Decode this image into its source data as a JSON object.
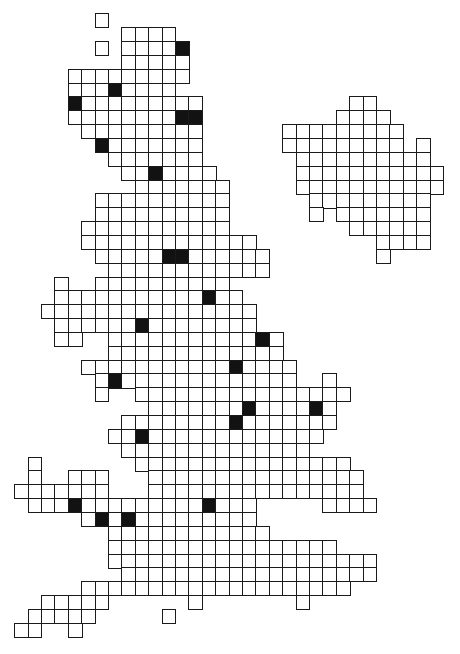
{
  "map": {
    "type": "grid-cartogram",
    "colors": {
      "background": "#ffffff",
      "cell_border": "#1a1a1a",
      "cell_empty": "#ffffff",
      "cell_filled": "#121212"
    },
    "regions": [
      {
        "name": "great-britain",
        "rows": [
          {
            "r": 0,
            "runs": [
              [
                2,
                2
              ]
            ],
            "filled": []
          },
          {
            "r": 1,
            "runs": [
              [
                4,
                7
              ]
            ],
            "filled": []
          },
          {
            "r": 2,
            "runs": [
              [
                2,
                2
              ],
              [
                4,
                8
              ]
            ],
            "filled": [
              8
            ]
          },
          {
            "r": 3,
            "runs": [
              [
                4,
                8
              ]
            ],
            "filled": []
          },
          {
            "r": 4,
            "runs": [
              [
                0,
                8
              ]
            ],
            "filled": []
          },
          {
            "r": 5,
            "runs": [
              [
                0,
                7
              ]
            ],
            "filled": [
              3
            ]
          },
          {
            "r": 6,
            "runs": [
              [
                0,
                9
              ]
            ],
            "filled": [
              0
            ]
          },
          {
            "r": 7,
            "runs": [
              [
                0,
                9
              ]
            ],
            "filled": [
              8,
              9
            ]
          },
          {
            "r": 8,
            "runs": [
              [
                1,
                9
              ]
            ],
            "filled": []
          },
          {
            "r": 9,
            "runs": [
              [
                2,
                9
              ]
            ],
            "filled": [
              2
            ]
          },
          {
            "r": 10,
            "runs": [
              [
                3,
                9
              ]
            ],
            "filled": []
          },
          {
            "r": 11,
            "runs": [
              [
                4,
                10
              ]
            ],
            "filled": [
              6
            ]
          },
          {
            "r": 12,
            "runs": [
              [
                5,
                11
              ]
            ],
            "filled": []
          },
          {
            "r": 13,
            "runs": [
              [
                2,
                11
              ]
            ],
            "filled": []
          },
          {
            "r": 14,
            "runs": [
              [
                2,
                11
              ]
            ],
            "filled": []
          },
          {
            "r": 15,
            "runs": [
              [
                1,
                11
              ]
            ],
            "filled": []
          },
          {
            "r": 16,
            "runs": [
              [
                1,
                13
              ]
            ],
            "filled": []
          },
          {
            "r": 17,
            "runs": [
              [
                2,
                14
              ]
            ],
            "filled": [
              7,
              8
            ]
          },
          {
            "r": 18,
            "runs": [
              [
                3,
                14
              ]
            ],
            "filled": []
          },
          {
            "r": 19,
            "runs": [
              [
                -1,
                -1
              ],
              [
                2,
                11
              ]
            ],
            "filled": []
          },
          {
            "r": 20,
            "runs": [
              [
                -1,
                12
              ]
            ],
            "filled": [
              10
            ]
          },
          {
            "r": 21,
            "runs": [
              [
                -2,
                13
              ]
            ],
            "filled": []
          },
          {
            "r": 22,
            "runs": [
              [
                -1,
                13
              ]
            ],
            "filled": [
              5
            ]
          },
          {
            "r": 23,
            "runs": [
              [
                -1,
                0
              ],
              [
                3,
                15
              ]
            ],
            "filled": [
              14
            ]
          },
          {
            "r": 24,
            "runs": [
              [
                3,
                15
              ]
            ],
            "filled": []
          },
          {
            "r": 25,
            "runs": [
              [
                1,
                16
              ]
            ],
            "filled": [
              12
            ]
          },
          {
            "r": 26,
            "runs": [
              [
                2,
                16
              ],
              [
                19,
                19
              ]
            ],
            "filled": [
              3
            ]
          },
          {
            "r": 27,
            "runs": [
              [
                2,
                2
              ],
              [
                5,
                20
              ]
            ],
            "filled": []
          },
          {
            "r": 28,
            "runs": [
              [
                6,
                19
              ]
            ],
            "filled": [
              13,
              18
            ]
          },
          {
            "r": 29,
            "runs": [
              [
                4,
                19
              ]
            ],
            "filled": [
              12
            ]
          },
          {
            "r": 30,
            "runs": [
              [
                3,
                18
              ]
            ],
            "filled": [
              5
            ]
          },
          {
            "r": 31,
            "runs": [
              [
                4,
                17
              ]
            ],
            "filled": []
          },
          {
            "r": 32,
            "runs": [
              [
                -3,
                -3
              ],
              [
                5,
                20
              ]
            ],
            "filled": []
          },
          {
            "r": 33,
            "runs": [
              [
                -3,
                -3
              ],
              [
                0,
                2
              ],
              [
                6,
                21
              ]
            ],
            "filled": []
          },
          {
            "r": 34,
            "runs": [
              [
                -4,
                2
              ],
              [
                6,
                21
              ]
            ],
            "filled": []
          },
          {
            "r": 35,
            "runs": [
              [
                -3,
                13
              ],
              [
                19,
                22
              ]
            ],
            "filled": [
              0,
              10
            ]
          },
          {
            "r": 36,
            "runs": [
              [
                1,
                13
              ]
            ],
            "filled": [
              2,
              4
            ]
          },
          {
            "r": 37,
            "runs": [
              [
                3,
                14
              ]
            ],
            "filled": []
          },
          {
            "r": 38,
            "runs": [
              [
                3,
                19
              ]
            ],
            "filled": []
          },
          {
            "r": 39,
            "runs": [
              [
                3,
                22
              ]
            ],
            "filled": []
          },
          {
            "r": 40,
            "runs": [
              [
                4,
                22
              ]
            ],
            "filled": []
          },
          {
            "r": 41,
            "runs": [
              [
                1,
                20
              ]
            ],
            "filled": []
          },
          {
            "r": 42,
            "runs": [
              [
                -2,
                2
              ],
              [
                9,
                9
              ],
              [
                17,
                17
              ]
            ],
            "filled": []
          },
          {
            "r": 43,
            "runs": [
              [
                -3,
                1
              ],
              [
                7,
                7
              ]
            ],
            "filled": []
          },
          {
            "r": 44,
            "runs": [
              [
                -4,
                -3
              ],
              [
                0,
                0
              ]
            ],
            "filled": []
          }
        ]
      },
      {
        "name": "ireland",
        "rows": [
          {
            "r": 6,
            "runs": [
              [
                21,
                22
              ]
            ],
            "filled": []
          },
          {
            "r": 7,
            "runs": [
              [
                20,
                23
              ]
            ],
            "filled": []
          },
          {
            "r": 8,
            "runs": [
              [
                16,
                24
              ]
            ],
            "filled": []
          },
          {
            "r": 9,
            "runs": [
              [
                16,
                24
              ],
              [
                26,
                26
              ]
            ],
            "filled": []
          },
          {
            "r": 10,
            "runs": [
              [
                17,
                26
              ]
            ],
            "filled": []
          },
          {
            "r": 11,
            "runs": [
              [
                17,
                27
              ]
            ],
            "filled": []
          },
          {
            "r": 12,
            "runs": [
              [
                17,
                27
              ]
            ],
            "filled": []
          },
          {
            "r": 13,
            "runs": [
              [
                18,
                26
              ]
            ],
            "filled": []
          },
          {
            "r": 14,
            "runs": [
              [
                18,
                18
              ],
              [
                20,
                26
              ]
            ],
            "filled": []
          },
          {
            "r": 15,
            "runs": [
              [
                21,
                26
              ]
            ],
            "filled": []
          },
          {
            "r": 16,
            "runs": [
              [
                23,
                26
              ]
            ],
            "filled": []
          },
          {
            "r": 17,
            "runs": [
              [
                23,
                23
              ]
            ],
            "filled": []
          }
        ]
      }
    ]
  }
}
